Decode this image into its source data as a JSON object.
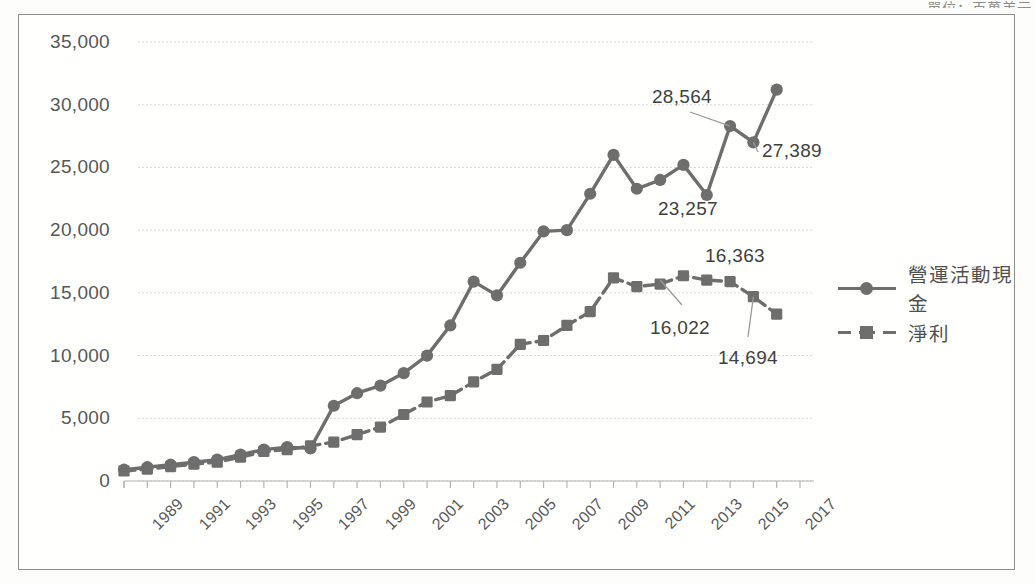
{
  "unit_note": "單位：百萬美元",
  "legend": {
    "position": "right",
    "items": [
      {
        "label": "營運活動現金",
        "marker": "circle",
        "style": "solid"
      },
      {
        "label": "淨利",
        "marker": "square",
        "style": "dashed"
      }
    ]
  },
  "colors": {
    "line": "#6e6e6e",
    "text": "#4a4a4a",
    "grid": "#d8d8d8",
    "border": "#8d8d8d"
  },
  "chart_data": {
    "type": "line",
    "title": "",
    "xlabel": "",
    "ylabel": "",
    "ylim": [
      0,
      35000
    ],
    "ytick_step": 5000,
    "ytick_labels": [
      "0",
      "5,000",
      "10,000",
      "15,000",
      "20,000",
      "25,000",
      "30,000",
      "35,000"
    ],
    "ytick_values": [
      0,
      5000,
      10000,
      15000,
      20000,
      25000,
      30000,
      35000
    ],
    "grid": true,
    "legend_position": "right",
    "x": [
      1989,
      1990,
      1991,
      1992,
      1993,
      1994,
      1995,
      1996,
      1997,
      1998,
      1999,
      2000,
      2001,
      2002,
      2003,
      2004,
      2005,
      2006,
      2007,
      2008,
      2009,
      2010,
      2011,
      2012,
      2013,
      2014,
      2015,
      2016,
      2017,
      2018
    ],
    "xtick_labels": [
      "1989",
      "1991",
      "1993",
      "1995",
      "1997",
      "1999",
      "2001",
      "2003",
      "2005",
      "2007",
      "2009",
      "2011",
      "2013",
      "2015",
      "2017"
    ],
    "xtick_values": [
      1989,
      1991,
      1993,
      1995,
      1997,
      1999,
      2001,
      2003,
      2005,
      2007,
      2009,
      2011,
      2013,
      2015,
      2017
    ],
    "series": [
      {
        "name": "營運活動現金",
        "marker": "circle",
        "style": "solid",
        "values": [
          900,
          1100,
          1300,
          1500,
          1700,
          2100,
          2500,
          2700,
          2600,
          6000,
          7000,
          7600,
          8600,
          10000,
          12400,
          15900,
          14800,
          17400,
          19900,
          20000,
          22900,
          26000,
          23300,
          24000,
          25200,
          22800,
          28300,
          27000,
          31200,
          null
        ]
      },
      {
        "name": "淨利",
        "marker": "square",
        "style": "dashed",
        "values": [
          800,
          950,
          1150,
          1350,
          1500,
          1900,
          2350,
          2500,
          2800,
          3100,
          3700,
          4300,
          5300,
          6300,
          6800,
          7900,
          8900,
          10900,
          11200,
          12400,
          13500,
          16200,
          15500,
          15700,
          16363,
          16022,
          15900,
          14694,
          13300,
          null
        ]
      }
    ],
    "annotations": [
      {
        "text": "28,564",
        "series": "營運活動現金",
        "x": 2015,
        "y": 28300
      },
      {
        "text": "27,389",
        "series": "營運活動現金",
        "x": 2016,
        "y": 27000
      },
      {
        "text": "23,257",
        "series": "營運活動現金",
        "x": 2014,
        "y": 22800
      },
      {
        "text": "16,363",
        "series": "淨利",
        "x": 2013,
        "y": 16363
      },
      {
        "text": "16,022",
        "series": "淨利",
        "x": 2012,
        "y": 16022
      },
      {
        "text": "14,694",
        "series": "淨利",
        "x": 2016,
        "y": 14694
      }
    ]
  }
}
